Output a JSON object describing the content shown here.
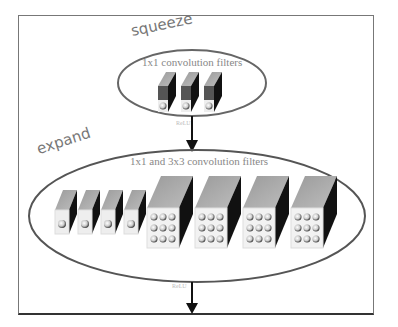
{
  "diagram": {
    "squeeze": {
      "label": "squeeze",
      "title": "1x1 convolution filters",
      "filter_count": 3,
      "filter_type": "1x1"
    },
    "expand": {
      "label": "expand",
      "title": "1x1 and 3x3 convolution filters",
      "filters_1x1_count": 4,
      "filters_3x3_count": 4
    },
    "activation_1": "ReLU",
    "activation_2": "ReLU"
  },
  "colors": {
    "border": "#777777",
    "ellipse": "#666666",
    "cube_top": "#aaaaaa",
    "cube_side": "#111111",
    "cube_front": "#eeeeee",
    "arrow": "#111111",
    "text": "#888888"
  }
}
